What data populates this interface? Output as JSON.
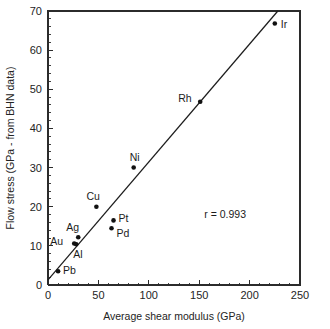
{
  "chart_data": {
    "type": "scatter",
    "title": "",
    "xlabel": "Average shear modulus (GPa)",
    "ylabel": "Flow stress (GPa - from BHN data)",
    "xlim": [
      0,
      250
    ],
    "ylim": [
      0,
      70
    ],
    "x_ticks": [
      0,
      50,
      100,
      150,
      200,
      250
    ],
    "y_ticks": [
      0,
      10,
      20,
      30,
      40,
      50,
      60,
      70
    ],
    "x_tick_labels": [
      "0",
      "50",
      "100",
      "150",
      "200",
      "250"
    ],
    "y_tick_labels": [
      "0",
      "10",
      "20",
      "30",
      "40",
      "50",
      "60",
      "70"
    ],
    "x_minor_step": 10,
    "y_minor_step": 2,
    "grid": false,
    "legend": "none",
    "annotations": [
      {
        "name": "correlation",
        "text": "r = 0.993",
        "x": 155,
        "y": 17
      }
    ],
    "fit_line": {
      "name": "linear-regression-line",
      "x_start": 0,
      "y_start": 1.3,
      "x_end": 228,
      "y_end": 70
    },
    "points": [
      {
        "label": "Pb",
        "x": 10,
        "y": 3.5,
        "label_dx": 5,
        "label_dy": 3
      },
      {
        "label": "Au",
        "x": 26,
        "y": 10.6,
        "label_dx": -24,
        "label_dy": 1
      },
      {
        "label": "Al",
        "x": 28,
        "y": 10.4,
        "label_dx": -3,
        "label_dy": 14
      },
      {
        "label": "Ag",
        "x": 30,
        "y": 12.2,
        "label_dx": -12,
        "label_dy": -6
      },
      {
        "label": "Cu",
        "x": 48,
        "y": 20.0,
        "label_dx": -10,
        "label_dy": -7
      },
      {
        "label": "Pd",
        "x": 63,
        "y": 14.5,
        "label_dx": 5,
        "label_dy": 9
      },
      {
        "label": "Pt",
        "x": 65,
        "y": 16.5,
        "label_dx": 5,
        "label_dy": 2
      },
      {
        "label": "Ni",
        "x": 85,
        "y": 30.0,
        "label_dx": -4,
        "label_dy": -7
      },
      {
        "label": "Rh",
        "x": 151,
        "y": 46.8,
        "label_dx": -22,
        "label_dy": 0
      },
      {
        "label": "Ir",
        "x": 225,
        "y": 66.8,
        "label_dx": 6,
        "label_dy": 4
      }
    ]
  }
}
